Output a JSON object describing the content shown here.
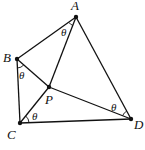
{
  "figure": {
    "type": "geometry-diagram",
    "points": [
      {
        "id": "A",
        "label": "A",
        "x": 76,
        "y": 17,
        "label_x": 71,
        "label_y": 10
      },
      {
        "id": "B",
        "label": "B",
        "x": 17,
        "y": 59,
        "label_x": 3,
        "label_y": 62
      },
      {
        "id": "P",
        "label": "P",
        "x": 49,
        "y": 87,
        "label_x": 45,
        "label_y": 104
      },
      {
        "id": "C",
        "label": "C",
        "x": 20,
        "y": 123,
        "label_x": 7,
        "label_y": 139
      },
      {
        "id": "D",
        "label": "D",
        "x": 131,
        "y": 119,
        "label_x": 134,
        "label_y": 129
      }
    ],
    "segments": [
      [
        "A",
        "B"
      ],
      [
        "A",
        "P"
      ],
      [
        "A",
        "D"
      ],
      [
        "B",
        "C"
      ],
      [
        "B",
        "P"
      ],
      [
        "P",
        "D"
      ],
      [
        "C",
        "P"
      ],
      [
        "C",
        "D"
      ]
    ],
    "angles": [
      {
        "vertex": "A",
        "label": "θ",
        "label_x": 61,
        "label_y": 36
      },
      {
        "vertex": "B",
        "label": "θ",
        "label_x": 19,
        "label_y": 79
      },
      {
        "vertex": "C",
        "label": "θ",
        "label_x": 32,
        "label_y": 120
      },
      {
        "vertex": "D",
        "label": "θ",
        "label_x": 111,
        "label_y": 111
      }
    ]
  }
}
